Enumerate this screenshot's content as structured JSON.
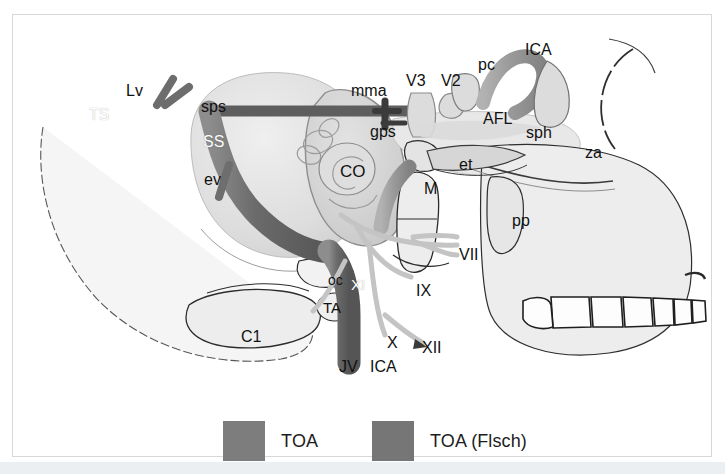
{
  "figure": {
    "background_color": "#ffffff",
    "frame_border_color": "#d8d8d8",
    "bottom_strip_color": "#eceff1"
  },
  "palette": {
    "bone_light": "#ececec",
    "bone_mid": "#dcdcdc",
    "bone_outline": "#2b2b2b",
    "vein_dark": "#6e6e6e",
    "vein_mid": "#8a8a8a",
    "artery_gray": "#9a9a9a",
    "nerve_light": "#c9c9c9",
    "toa_shade": "#7d7d7d",
    "toa_flsch_shade": "#767676",
    "label_color": "#1a1a1a",
    "label_white": "#ffffff"
  },
  "labels": [
    {
      "id": "Lv",
      "text": "Lv",
      "x": 113,
      "y": 68,
      "size": 16,
      "style": "dark",
      "desc": "vein-of-labbe"
    },
    {
      "id": "TS",
      "text": "TS",
      "x": 76,
      "y": 92,
      "size": 16,
      "style": "white",
      "desc": "transverse-sinus"
    },
    {
      "id": "sps",
      "text": "sps",
      "x": 188,
      "y": 84,
      "size": 16,
      "style": "dark",
      "desc": "superior-petrosal-sinus"
    },
    {
      "id": "SS",
      "text": "SS",
      "x": 190,
      "y": 119,
      "size": 16,
      "style": "white",
      "desc": "sigmoid-sinus"
    },
    {
      "id": "ev",
      "text": "ev",
      "x": 191,
      "y": 157,
      "size": 16,
      "style": "dark",
      "desc": "emissary-vein"
    },
    {
      "id": "CO",
      "text": "CO",
      "x": 327,
      "y": 148,
      "size": 17,
      "style": "dark",
      "desc": "cochlea"
    },
    {
      "id": "mma",
      "text": "mma",
      "x": 338,
      "y": 68,
      "size": 16,
      "style": "dark",
      "desc": "middle-meningeal-artery"
    },
    {
      "id": "gps",
      "text": "gps",
      "x": 357,
      "y": 109,
      "size": 16,
      "style": "dark",
      "desc": "greater-petrosal-nerve"
    },
    {
      "id": "V3",
      "text": "V3",
      "x": 393,
      "y": 58,
      "size": 16,
      "style": "dark",
      "desc": "mandibular-nerve"
    },
    {
      "id": "V2",
      "text": "V2",
      "x": 428,
      "y": 58,
      "size": 16,
      "style": "dark",
      "desc": "maxillary-nerve"
    },
    {
      "id": "pc",
      "text": "pc",
      "x": 465,
      "y": 42,
      "size": 16,
      "style": "dark",
      "desc": "posterior-clinoid"
    },
    {
      "id": "ICA1",
      "text": "ICA",
      "x": 512,
      "y": 27,
      "size": 16,
      "style": "dark",
      "desc": "internal-carotid-artery-upper"
    },
    {
      "id": "AFL",
      "text": "AFL",
      "x": 470,
      "y": 96,
      "size": 16,
      "style": "dark",
      "desc": "anterior-foramen-lacerum"
    },
    {
      "id": "sph",
      "text": "sph",
      "x": 513,
      "y": 110,
      "size": 16,
      "style": "dark",
      "desc": "sphenoid"
    },
    {
      "id": "za",
      "text": "za",
      "x": 572,
      "y": 130,
      "size": 16,
      "style": "dark",
      "desc": "zygomatic-arch"
    },
    {
      "id": "et",
      "text": "et",
      "x": 446,
      "y": 142,
      "size": 16,
      "style": "dark",
      "desc": "eustachian-tube"
    },
    {
      "id": "M",
      "text": "M",
      "x": 411,
      "y": 166,
      "size": 16,
      "style": "dark",
      "desc": "mandible"
    },
    {
      "id": "pp",
      "text": "pp",
      "x": 499,
      "y": 198,
      "size": 16,
      "style": "dark",
      "desc": "pterygoid-plate"
    },
    {
      "id": "VII",
      "text": "VII",
      "x": 446,
      "y": 232,
      "size": 16,
      "style": "dark",
      "desc": "facial-nerve"
    },
    {
      "id": "IX",
      "text": "IX",
      "x": 403,
      "y": 268,
      "size": 16,
      "style": "dark",
      "desc": "glossopharyngeal-nerve"
    },
    {
      "id": "oc",
      "text": "oc",
      "x": 315,
      "y": 258,
      "size": 14,
      "style": "dark",
      "desc": "occipital-condyle"
    },
    {
      "id": "XI",
      "text": "XI",
      "x": 338,
      "y": 262,
      "size": 15,
      "style": "white",
      "desc": "accessory-nerve"
    },
    {
      "id": "TA",
      "text": "TA",
      "x": 310,
      "y": 285,
      "size": 15,
      "style": "dark",
      "desc": "transverse-process-atlas"
    },
    {
      "id": "C1",
      "text": "C1",
      "x": 228,
      "y": 314,
      "size": 16,
      "style": "dark",
      "desc": "atlas-vertebra"
    },
    {
      "id": "X",
      "text": "X",
      "x": 374,
      "y": 320,
      "size": 16,
      "style": "dark",
      "desc": "vagus-nerve"
    },
    {
      "id": "XII",
      "text": "XII",
      "x": 409,
      "y": 325,
      "size": 16,
      "style": "dark",
      "desc": "hypoglossal-nerve"
    },
    {
      "id": "JV",
      "text": "JV",
      "x": 326,
      "y": 344,
      "size": 16,
      "style": "dark",
      "desc": "jugular-vein"
    },
    {
      "id": "ICA2",
      "text": "ICA",
      "x": 357,
      "y": 344,
      "size": 16,
      "style": "dark",
      "desc": "internal-carotid-artery-lower"
    }
  ],
  "legend": {
    "items": [
      {
        "label": "TOA",
        "color": "#7d7d7d"
      },
      {
        "label": "TOA (Flsch)",
        "color": "#767676"
      }
    ]
  }
}
